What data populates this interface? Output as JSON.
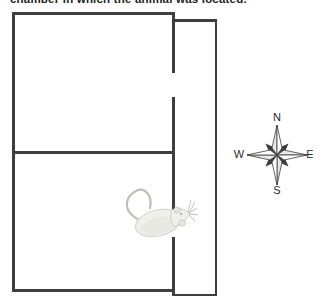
{
  "caption": {
    "text": "chamber in which the animal was located."
  },
  "apparatus": {
    "description": "two-chamber box with door gaps opening into a narrow corridor on the right; a rat passes through the lower door",
    "wall_color": "#3e3e3e"
  },
  "compass": {
    "labels": {
      "north": "N",
      "south": "S",
      "east": "E",
      "west": "W"
    },
    "dark_point_color": "#3d3d3d",
    "light_point_color": "#ffffff",
    "shaded_half_color": "#e8e8e8"
  },
  "rat": {
    "body_color": "#efefec",
    "outline_color": "#cfcfca"
  },
  "colors": {
    "background": "#ffffff",
    "caption_text": "#1c1c1c",
    "compass_label_text": "#2b2b2b"
  }
}
